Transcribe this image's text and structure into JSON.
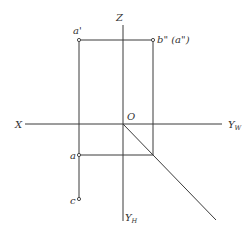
{
  "diagram": {
    "type": "orthographic projection (three-view) construction",
    "axes": {
      "x_label": "X",
      "z_label": "Z",
      "yw_label": "Y",
      "yw_sub": "W",
      "yh_label": "Y",
      "yh_sub": "H",
      "origin_label": "O"
    },
    "points": {
      "a_prime": "a'",
      "b_dprime": "b\" (a\")",
      "a": "a",
      "c": "c"
    },
    "colors": {
      "line": "#3a3a3a",
      "text": "#333333",
      "background": "#ffffff"
    }
  }
}
